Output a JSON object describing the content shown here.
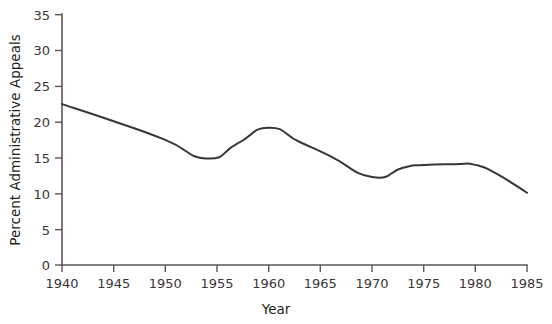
{
  "chart_data": {
    "type": "line",
    "title": "",
    "subtitle": "",
    "xlabel": "Year",
    "ylabel": "Percent Administrative Appeals",
    "xlim": [
      1940,
      1985
    ],
    "ylim": [
      0,
      35
    ],
    "xticks": [
      1940,
      1945,
      1950,
      1955,
      1960,
      1965,
      1970,
      1975,
      1980,
      1985
    ],
    "yticks": [
      0,
      5,
      10,
      15,
      20,
      25,
      30,
      35
    ],
    "xtick_labels": [
      "1940",
      "1945",
      "1950",
      "1955",
      "1960",
      "1965",
      "1970",
      "1975",
      "1980",
      "1985"
    ],
    "ytick_labels": [
      "0",
      "5",
      "10",
      "15",
      "20",
      "25",
      "30",
      "35"
    ],
    "grid": false,
    "legend": false,
    "legend_position": "none",
    "line_color": "#3a3537",
    "axis_color": "#5b5658",
    "series": [
      {
        "name": "Percent Administrative Appeals",
        "x": [
          1940,
          1945,
          1950,
          1954,
          1957,
          1960,
          1963,
          1966,
          1970,
          1973,
          1975,
          1978,
          1980,
          1982,
          1985
        ],
        "values": [
          22.5,
          20.1,
          17.5,
          14.9,
          17.0,
          19.2,
          17.2,
          15.2,
          12.3,
          13.6,
          14.0,
          14.1,
          14.0,
          12.8,
          10.1
        ]
      }
    ],
    "annotations": []
  },
  "axis": {
    "xlabel": "Year",
    "ylabel": "Percent Administrative Appeals"
  }
}
